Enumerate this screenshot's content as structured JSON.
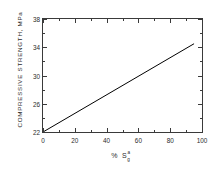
{
  "chart_data": {
    "type": "line",
    "title": "",
    "xlabel": "% S",
    "xlabel_parts": {
      "percent": "%",
      "symbol": "S",
      "superscript": "a",
      "subscript": "g"
    },
    "ylabel": "COMPRESSIVE STRENGTH, MPa",
    "xlim": [
      0,
      100
    ],
    "ylim": [
      22,
      38
    ],
    "xticks": [
      0,
      20,
      40,
      60,
      80,
      100
    ],
    "xtick_labels": [
      "0",
      "20",
      "40",
      "60",
      "80",
      "100"
    ],
    "yticks": [
      22,
      26,
      30,
      34,
      38
    ],
    "ytick_labels": [
      "22",
      "26",
      "30",
      "34",
      "38"
    ],
    "x_minor_interval": 10,
    "y_minor_interval": 2,
    "grid": false,
    "legend": false,
    "series": [
      {
        "name": "compressive strength vs sulfur content",
        "x": [
          0,
          95
        ],
        "values": [
          22.0,
          34.5
        ],
        "color": "#000000"
      }
    ],
    "line_color": "#000000",
    "axis_color": "#3a3a3a",
    "background": "#ffffff"
  }
}
